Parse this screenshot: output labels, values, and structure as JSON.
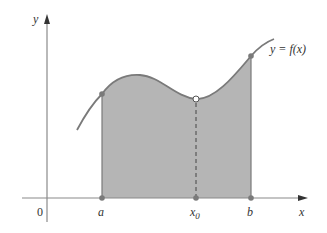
{
  "diagram": {
    "axes": {
      "x_label": "x",
      "y_label": "y",
      "origin_label": "0"
    },
    "curve_label": "y = f(x)",
    "points": {
      "a_label": "a",
      "x0_label": "x",
      "x0_subscript": "0",
      "b_label": "b"
    },
    "colors": {
      "fill": "#b5b5b5",
      "curve": "#7a7a7a",
      "axis": "#8a8a8a",
      "text": "#333333"
    }
  }
}
